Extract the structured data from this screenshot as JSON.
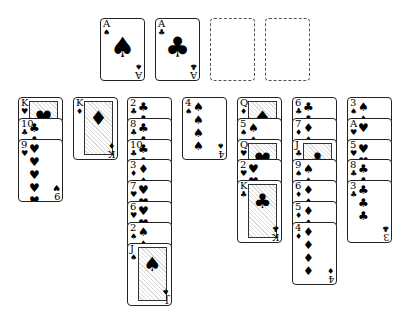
{
  "game": "Solitaire",
  "foundations": [
    {
      "rank": "A",
      "suit": "♠",
      "empty": false
    },
    {
      "rank": "A",
      "suit": "♣",
      "empty": false
    },
    {
      "rank": "",
      "suit": "",
      "empty": true
    },
    {
      "rank": "",
      "suit": "",
      "empty": true
    }
  ],
  "tableau": [
    [
      {
        "rank": "K",
        "suit": "♥"
      },
      {
        "rank": "10",
        "suit": "♣"
      },
      {
        "rank": "9",
        "suit": "♥"
      }
    ],
    [
      {
        "rank": "K",
        "suit": "♦"
      }
    ],
    [
      {
        "rank": "2",
        "suit": "♣"
      },
      {
        "rank": "8",
        "suit": "♣"
      },
      {
        "rank": "10",
        "suit": "♣"
      },
      {
        "rank": "3",
        "suit": "♦"
      },
      {
        "rank": "7",
        "suit": "♥"
      },
      {
        "rank": "6",
        "suit": "♥"
      },
      {
        "rank": "2",
        "suit": "♠"
      },
      {
        "rank": "J",
        "suit": "♠"
      }
    ],
    [
      {
        "rank": "4",
        "suit": "♠"
      }
    ],
    [
      {
        "rank": "Q",
        "suit": "♦"
      },
      {
        "rank": "5",
        "suit": "♠"
      },
      {
        "rank": "Q",
        "suit": "♥"
      },
      {
        "rank": "2",
        "suit": "♥"
      },
      {
        "rank": "K",
        "suit": "♣"
      }
    ],
    [
      {
        "rank": "6",
        "suit": "♣"
      },
      {
        "rank": "7",
        "suit": "♦"
      },
      {
        "rank": "J",
        "suit": "♣"
      },
      {
        "rank": "9",
        "suit": "♠"
      },
      {
        "rank": "6",
        "suit": "♦"
      },
      {
        "rank": "5",
        "suit": "♦"
      },
      {
        "rank": "4",
        "suit": "♦"
      }
    ],
    [
      {
        "rank": "3",
        "suit": "♠"
      },
      {
        "rank": "A",
        "suit": "♥"
      },
      {
        "rank": "5",
        "suit": "♥"
      },
      {
        "rank": "8",
        "suit": "♣"
      },
      {
        "rank": "3",
        "suit": "♣"
      }
    ]
  ]
}
